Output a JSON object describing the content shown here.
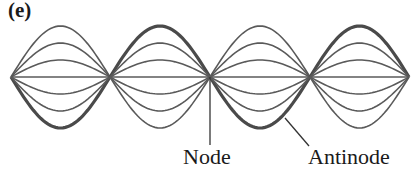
{
  "panel_label": "(e)",
  "labels": {
    "node": "Node",
    "antinode": "Antinode"
  },
  "wave": {
    "nodes_x": [
      11,
      110,
      210,
      310,
      409
    ],
    "center_y": 77,
    "amplitudes": [
      51,
      34,
      17
    ],
    "thick_outer": [
      "bottom",
      "top",
      "bottom",
      "top"
    ],
    "line_color": "#5a5a5a",
    "thick_color": "#4a4a4a"
  }
}
